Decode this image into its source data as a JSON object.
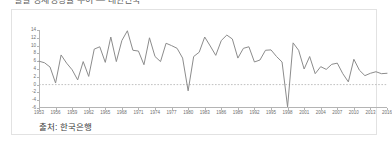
{
  "figure": {
    "title_clipped": "실질 경제성장률 추이 — 대한민국",
    "source_note": "출처: 한국은행",
    "line_color": "#8c8c8c",
    "zero_line_color": "#b0b0b0",
    "axis_color": "#b4b4b4",
    "border_color": "#e2e2e2",
    "background": "#ffffff"
  },
  "chart_data": {
    "type": "line",
    "title": "실질 경제성장률 추이 — 대한민국",
    "xlabel": "",
    "ylabel": "",
    "xlim": [
      1953,
      2016
    ],
    "ylim": [
      -6,
      14
    ],
    "yticks": [
      14,
      12,
      10,
      8,
      6,
      4,
      2,
      0,
      -2,
      -4,
      -6
    ],
    "ytick_labels": [
      "14",
      "12",
      "10",
      "8",
      "6",
      "4",
      "2",
      "0",
      "-2",
      "-4",
      "-6"
    ],
    "xticks": [
      1953,
      1956,
      1959,
      1962,
      1965,
      1968,
      1971,
      1974,
      1977,
      1980,
      1983,
      1986,
      1989,
      1992,
      1995,
      1998,
      2001,
      2004,
      2007,
      2010,
      2013,
      2016
    ],
    "xtick_labels": [
      "1953",
      "1956",
      "1959",
      "1962",
      "1965",
      "1968",
      "1971",
      "1974",
      "1977",
      "1980",
      "1983",
      "1986",
      "1989",
      "1992",
      "1995",
      "1998",
      "2001",
      "2004",
      "2007",
      "2010",
      "2013",
      "2016"
    ],
    "grid": false,
    "legend": null,
    "reference_lines": [
      {
        "axis": "y",
        "value": 0,
        "style": "dashed"
      }
    ],
    "x": [
      1953,
      1954,
      1955,
      1956,
      1957,
      1958,
      1959,
      1960,
      1961,
      1962,
      1963,
      1964,
      1965,
      1966,
      1967,
      1968,
      1969,
      1970,
      1971,
      1972,
      1973,
      1974,
      1975,
      1976,
      1977,
      1978,
      1979,
      1980,
      1981,
      1982,
      1983,
      1984,
      1985,
      1986,
      1987,
      1988,
      1989,
      1990,
      1991,
      1992,
      1993,
      1994,
      1995,
      1996,
      1997,
      1998,
      1999,
      2000,
      2001,
      2002,
      2003,
      2004,
      2005,
      2006,
      2007,
      2008,
      2009,
      2010,
      2011,
      2012,
      2013,
      2014,
      2015,
      2016
    ],
    "values": [
      6.0,
      5.6,
      4.5,
      0.4,
      7.6,
      5.5,
      3.8,
      1.2,
      5.9,
      2.1,
      9.1,
      9.7,
      5.7,
      12.2,
      5.9,
      11.3,
      13.8,
      8.8,
      8.6,
      5.1,
      12.0,
      7.2,
      5.9,
      10.6,
      10.0,
      9.3,
      6.8,
      -1.6,
      7.2,
      8.3,
      12.2,
      9.9,
      7.5,
      11.3,
      12.7,
      11.7,
      6.8,
      9.3,
      9.7,
      5.8,
      6.3,
      8.8,
      8.9,
      7.2,
      5.8,
      -5.7,
      10.7,
      8.8,
      4.0,
      7.2,
      2.8,
      4.6,
      3.9,
      5.2,
      5.5,
      2.8,
      0.7,
      6.5,
      3.7,
      2.3,
      2.9,
      3.3,
      2.8,
      2.9
    ]
  }
}
